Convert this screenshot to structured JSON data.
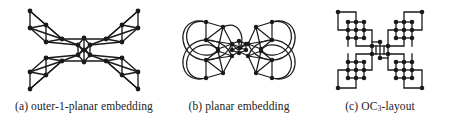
{
  "figure": {
    "name": "graph-embedding-comparison",
    "background_color": "#ffffff",
    "ink_color": "#1a1a1a",
    "subfigures": [
      {
        "id": "a",
        "tag": "(a)",
        "caption": "(a) outer-1-planar embedding",
        "caption_text": "outer-1-planar embedding",
        "style": "straight-line-crossing",
        "vertex_count": 24,
        "cluster_count": 4,
        "center_shape": "diamond"
      },
      {
        "id": "b",
        "tag": "(b)",
        "caption": "(b) planar embedding",
        "caption_text": "planar embedding",
        "style": "curved-arcs-planar",
        "vertex_count": 24,
        "cluster_count": 4,
        "center_shape": "diamond"
      },
      {
        "id": "c",
        "tag": "(c)",
        "caption_prefix": "(c) OC",
        "caption_subscript": "3",
        "caption_suffix": "-layout",
        "caption": "(c) OC3-layout",
        "style": "orthogonal-grid",
        "vertex_count": 24,
        "cluster_count": 4,
        "center_shape": "rectangle"
      }
    ]
  }
}
